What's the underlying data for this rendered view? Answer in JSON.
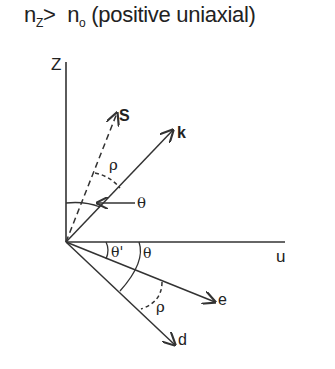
{
  "title": {
    "n_z_base": "n",
    "n_z_sub": "Z",
    "comparator": ">",
    "n_o_base": "n",
    "n_o_sub": "o",
    "description": "(positive uniaxial)"
  },
  "axes": {
    "vertical_label": "Z",
    "horizontal_label": "u"
  },
  "vectors": {
    "s": "S",
    "k": "k",
    "e": "e",
    "d": "d"
  },
  "angles": {
    "rho_upper": "ρ",
    "theta_upper": "θ",
    "theta_prime": "θ'",
    "theta_lower": "θ",
    "rho_lower": "ρ"
  },
  "colors": {
    "line": "#333333",
    "text": "#222222",
    "background": "#ffffff"
  }
}
